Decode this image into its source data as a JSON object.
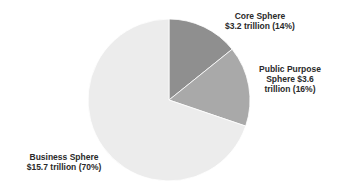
{
  "chart_data": {
    "type": "pie",
    "title": "",
    "categories": [
      "Core Sphere",
      "Public Purpose Sphere",
      "Business Sphere"
    ],
    "values": [
      3.2,
      3.6,
      15.7
    ],
    "percentages": [
      14,
      16,
      70
    ],
    "unit": "trillion USD",
    "colors": [
      "#8f8f8f",
      "#a9a9a9",
      "#ececec"
    ],
    "start_angle_deg": 0,
    "direction": "clockwise",
    "legend": "none (direct labels)"
  },
  "labels": {
    "core": {
      "line1": "Core Sphere",
      "line2": "$3.2 trillion (14%)"
    },
    "public": {
      "line1": "Public Purpose",
      "line2": "Sphere $3.6",
      "line3": "trillion (16%)"
    },
    "business": {
      "line1": "Business Sphere",
      "line2": "$15.7 trillion (70%)"
    }
  }
}
